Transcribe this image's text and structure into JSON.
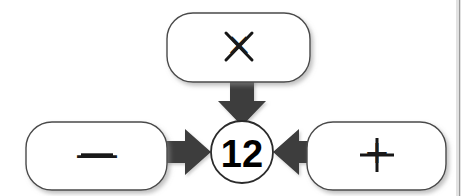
{
  "diagram": {
    "type": "operation-target-diagram",
    "background_color": "#ffffff",
    "node_fill": "#ffffff",
    "node_stroke": "#4a4a4a",
    "arrow_color": "#3c3c3c",
    "text_color": "#111111",
    "divider_color": "#9a9a9a",
    "center": {
      "name": "result-node",
      "shape": "circle",
      "value": "12",
      "cx": 242,
      "cy": 152,
      "r": 31
    },
    "operand_nodes": [
      {
        "name": "multiply-node",
        "shape": "rounded-rect",
        "symbol": "×",
        "symbol_name": "multiply-sign",
        "position": "top",
        "x": 167,
        "y": 13,
        "width": 143,
        "height": 69,
        "radius": 26
      },
      {
        "name": "minus-node",
        "shape": "rounded-rect",
        "symbol": "—",
        "symbol_name": "minus-sign",
        "position": "left",
        "x": 26,
        "y": 122,
        "width": 141,
        "height": 68,
        "radius": 26
      },
      {
        "name": "plus-node",
        "shape": "rounded-rect",
        "symbol": "+",
        "symbol_name": "plus-sign",
        "position": "right",
        "x": 307,
        "y": 122,
        "width": 139,
        "height": 68,
        "radius": 26
      }
    ],
    "arrows": [
      {
        "name": "arrow-down-to-result",
        "direction": "down",
        "from": "multiply-node",
        "to": "result-node"
      },
      {
        "name": "arrow-right-to-result",
        "direction": "right",
        "from": "minus-node",
        "to": "result-node"
      },
      {
        "name": "arrow-left-to-result",
        "direction": "left",
        "from": "plus-node",
        "to": "result-node"
      }
    ],
    "divider": {
      "name": "right-edge-divider",
      "orientation": "vertical",
      "x": 459
    }
  }
}
